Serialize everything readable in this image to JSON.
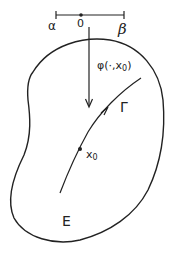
{
  "diagram": {
    "interval": {
      "left_label": "α",
      "origin_label": "0",
      "right_label": "β"
    },
    "flow_label": "φ(·,x",
    "flow_label_sub": "0",
    "flow_label_close": ")",
    "curve_label": "Γ",
    "point_label": "x",
    "point_label_sub": "0",
    "region_label": "E",
    "stroke_color": "#222222"
  }
}
